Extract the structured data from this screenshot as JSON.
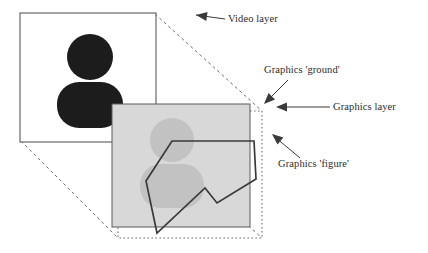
{
  "figure": {
    "background_color": "#ffffff"
  },
  "colors": {
    "video_layer_fill": "#ffffff",
    "video_layer_stroke": "#4a4a4a",
    "video_silhouette": "#1c1c1c",
    "graphics_layer_fill": "#d8d8d8",
    "graphics_layer_stroke": "#5a5a5a",
    "graphics_silhouette": "#c2c2c2",
    "graphics_ground_dotted": "#6e6e6e",
    "graphics_figure_stroke": "#3a3a3a",
    "perspective_dashed": "#6e6e6e",
    "leader_line": "#3a3a3a",
    "text": "#2b2b2b"
  },
  "video_layer": {
    "name": "Video layer",
    "rect": {
      "x": 20,
      "y": 13,
      "width": 136,
      "height": 129
    },
    "silhouette": {
      "head": {
        "cx": 90,
        "cy": 57,
        "r": 23
      },
      "body": {
        "x": 57,
        "y": 82,
        "width": 66,
        "height": 46,
        "corner_radius": 22
      }
    }
  },
  "graphics_layer": {
    "name": "Graphics layer",
    "rect": {
      "x": 112,
      "y": 104,
      "width": 138,
      "height": 123
    },
    "silhouette": {
      "head": {
        "cx": 172,
        "cy": 140,
        "r": 22
      },
      "body": {
        "x": 140,
        "y": 164,
        "width": 64,
        "height": 44,
        "corner_radius": 21
      }
    }
  },
  "graphics_ground": {
    "name": "Graphics 'ground'",
    "rect": {
      "x": 118,
      "y": 111,
      "width": 144,
      "height": 127
    }
  },
  "graphics_figure": {
    "name": "Graphics 'figure'",
    "points": "172,141 254,141 256,179 217,203 205,188 157,233 146,181"
  },
  "perspective_lines": [
    {
      "name": "top-left-to-ground-top-left",
      "x1": 21,
      "y1": 14,
      "x2": 118,
      "y2": 111
    },
    {
      "name": "top-right-to-ground-top-right",
      "x1": 155,
      "y1": 14,
      "x2": 262,
      "y2": 111
    },
    {
      "name": "bottom-left-to-ground-bottom-left",
      "x1": 21,
      "y1": 141,
      "x2": 118,
      "y2": 238
    },
    {
      "name": "bottom-right-to-ground-bottom-right",
      "x1": 155,
      "y1": 141,
      "x2": 262,
      "y2": 238
    }
  ],
  "annotations": [
    {
      "id": "video-layer",
      "label": "Video layer",
      "text_x": 228,
      "text_y": 22,
      "leader": {
        "x1": 225,
        "y1": 19,
        "x2": 196,
        "y2": 15
      },
      "arrow": {
        "x": 196,
        "y": 15,
        "angle": 188
      }
    },
    {
      "id": "graphics-ground",
      "label": "Graphics 'ground'",
      "text_x": 264,
      "text_y": 73,
      "leader": {
        "x1": 288,
        "y1": 80,
        "x2": 266,
        "y2": 102
      },
      "arrow": {
        "x": 264,
        "y": 104,
        "angle": 135
      }
    },
    {
      "id": "graphics-layer",
      "label": "Graphics layer",
      "text_x": 333,
      "text_y": 110,
      "leader": {
        "x1": 330,
        "y1": 107,
        "x2": 280,
        "y2": 107
      },
      "arrow": {
        "x": 276,
        "y": 107,
        "angle": 180
      }
    },
    {
      "id": "graphics-figure",
      "label": "Graphics 'figure'",
      "text_x": 278,
      "text_y": 167,
      "leader": {
        "x1": 300,
        "y1": 158,
        "x2": 275,
        "y2": 137
      },
      "arrow": {
        "x": 272,
        "y": 134,
        "angle": 220
      }
    }
  ]
}
